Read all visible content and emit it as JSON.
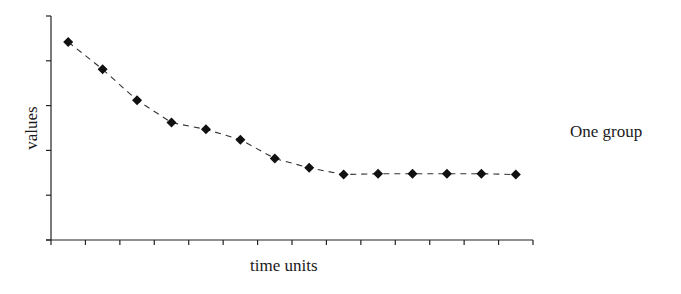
{
  "chart_data": {
    "type": "line",
    "title": "",
    "xlabel": "time units",
    "ylabel": "values",
    "x": [
      1,
      2,
      3,
      4,
      5,
      6,
      7,
      8,
      9,
      10,
      11,
      12,
      13,
      14
    ],
    "series": [
      {
        "name": "One group",
        "values": [
          4.42,
          3.81,
          3.12,
          2.62,
          2.47,
          2.24,
          1.82,
          1.61,
          1.46,
          1.48,
          1.48,
          1.48,
          1.48,
          1.46
        ],
        "marker": "diamond",
        "line_style": "dashed",
        "color": "#111111"
      }
    ],
    "ylim": [
      0,
      5
    ],
    "xlim": [
      0,
      14
    ],
    "y_ticks": 6,
    "x_ticks": 15,
    "tick_labels_shown": false,
    "grid": false,
    "legend_position": "right"
  },
  "legend": {
    "label": "One group"
  },
  "axes": {
    "x_title": "time units",
    "y_title": "values"
  }
}
